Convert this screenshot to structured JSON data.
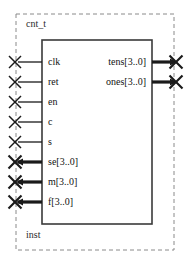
{
  "diagram": {
    "type": "block-symbol",
    "block_name": "cnt_t",
    "instance_name": "inst",
    "colors": {
      "boundary": "#8a8a8a",
      "block_outline": "#3a3a3a",
      "wire": "#1a1a1a",
      "text": "#121212",
      "background": "#ffffff"
    },
    "geometry": {
      "boundary": {
        "x": 16,
        "y": 14,
        "width": 158,
        "height": 236
      },
      "block": {
        "x": 42,
        "y": 40,
        "width": 110,
        "height": 184
      }
    },
    "inputs": [
      {
        "label": "clk",
        "bus": false,
        "width": 1,
        "y": 62,
        "pin_x": 15
      },
      {
        "label": "ret",
        "bus": false,
        "width": 1,
        "y": 82,
        "pin_x": 15
      },
      {
        "label": "en",
        "bus": false,
        "width": 1,
        "y": 102,
        "pin_x": 15
      },
      {
        "label": "c",
        "bus": false,
        "width": 1,
        "y": 122,
        "pin_x": 15
      },
      {
        "label": "s",
        "bus": false,
        "width": 1,
        "y": 142,
        "pin_x": 15
      },
      {
        "label": "se[3..0]",
        "bus": true,
        "width": 4,
        "y": 162,
        "pin_x": 15
      },
      {
        "label": "m[3..0]",
        "bus": true,
        "width": 4,
        "y": 182,
        "pin_x": 15
      },
      {
        "label": "f[3..0]",
        "bus": true,
        "width": 4,
        "y": 202,
        "pin_x": 15
      }
    ],
    "outputs": [
      {
        "label": "tens[3..0]",
        "bus": true,
        "width": 4,
        "y": 62,
        "pin_x": 176
      },
      {
        "label": "ones[3..0]",
        "bus": true,
        "width": 4,
        "y": 82,
        "pin_x": 176
      }
    ]
  }
}
